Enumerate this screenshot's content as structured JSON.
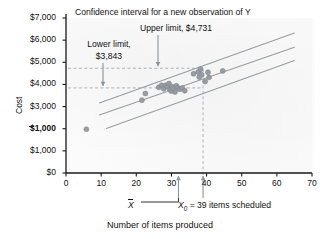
{
  "chart_data": {
    "type": "scatter",
    "title": "Confidence interval for a new observation of Y",
    "xlabel": "Number of items produced",
    "ylabel": "Cost",
    "xlim": [
      0,
      70
    ],
    "ylim": [
      0,
      7000
    ],
    "grid": false,
    "legend": "none",
    "xticks": [
      "0",
      "10",
      "20",
      "30",
      "40",
      "50",
      "60",
      "70"
    ],
    "xtick_values": [
      0,
      10,
      20,
      30,
      40,
      50,
      60,
      70
    ],
    "yticks": [
      "$0",
      "$1,000",
      "$2,000",
      "$3,000",
      "$4,000",
      "$5,000",
      "$6,000",
      "$7,000"
    ],
    "ytick_values": [
      0,
      1000,
      2000,
      3000,
      4000,
      5000,
      6000,
      7000
    ],
    "ytick_note": "The $2,000 label is degraded in the scan and prints as an overstruck '$1,000'.",
    "points": [
      {
        "x": 5.8,
        "y": 1980
      },
      {
        "x": 21.6,
        "y": 3290
      },
      {
        "x": 22.6,
        "y": 3590
      },
      {
        "x": 26.4,
        "y": 3870
      },
      {
        "x": 27.2,
        "y": 3960
      },
      {
        "x": 27.8,
        "y": 3800
      },
      {
        "x": 28.4,
        "y": 3960
      },
      {
        "x": 28.9,
        "y": 3880
      },
      {
        "x": 29.3,
        "y": 4040
      },
      {
        "x": 29.6,
        "y": 3760
      },
      {
        "x": 29.9,
        "y": 3700
      },
      {
        "x": 30.2,
        "y": 3900
      },
      {
        "x": 30.6,
        "y": 3830
      },
      {
        "x": 31.0,
        "y": 3660
      },
      {
        "x": 31.4,
        "y": 3940
      },
      {
        "x": 31.9,
        "y": 3840
      },
      {
        "x": 32.4,
        "y": 3780
      },
      {
        "x": 33.1,
        "y": 3840
      },
      {
        "x": 33.8,
        "y": 3720
      },
      {
        "x": 36.3,
        "y": 4480
      },
      {
        "x": 37.6,
        "y": 4560
      },
      {
        "x": 37.9,
        "y": 4330
      },
      {
        "x": 38.3,
        "y": 4690
      },
      {
        "x": 38.6,
        "y": 4440
      },
      {
        "x": 39.6,
        "y": 4130
      },
      {
        "x": 40.4,
        "y": 4550
      },
      {
        "x": 40.7,
        "y": 4320
      },
      {
        "x": 44.6,
        "y": 4610
      }
    ],
    "lines": [
      {
        "name": "regression-line",
        "x": [
          9.5,
          65.0
        ],
        "y": [
          2620,
          5680
        ]
      },
      {
        "name": "upper-prediction-band",
        "x": [
          9.5,
          65.0
        ],
        "y": [
          3160,
          6320
        ]
      },
      {
        "name": "lower-prediction-band",
        "x": [
          11.5,
          65.0
        ],
        "y": [
          2010,
          5080
        ]
      }
    ],
    "reference_lines": [
      {
        "name": "upper-limit-gridline",
        "orient": "horizontal",
        "value": 4731,
        "style": "dashed"
      },
      {
        "name": "lower-limit-gridline",
        "orient": "horizontal",
        "value": 3843,
        "style": "dashed"
      },
      {
        "name": "x0-gridline",
        "orient": "vertical",
        "value": 39,
        "style": "dashed"
      }
    ],
    "annotations": {
      "title": "Confidence interval for a new observation of Y",
      "upper_limit": "Upper limit, $4,731",
      "upper_limit_value": 4731,
      "lower_limit_line1": "Lower limit,",
      "lower_limit_line2": "$3,843",
      "lower_limit_value": 3843,
      "xbar_label": "X",
      "xbar_value": 32,
      "x0_prefix": "X",
      "x0_sub": "0",
      "x0_text": " = 39 items scheduled",
      "x0_value": 39
    }
  },
  "colors": {
    "axis": "#1a1a1a",
    "text": "#111111",
    "point": "#9aa0a6",
    "point_edge": "#7e858c",
    "band": "#9aa0a6",
    "dashed": "#a8aeb4",
    "arrow": "#8f969c",
    "background": "#ffffff"
  }
}
